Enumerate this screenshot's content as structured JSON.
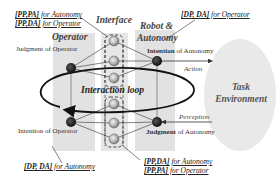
{
  "diagram": {
    "columns": {
      "operator": {
        "label": "Operator"
      },
      "interface": {
        "label": "Interface"
      },
      "robot": {
        "label_line1": "Robot &",
        "label_line2": "Autonomy"
      }
    },
    "nodes": {
      "judgment_operator": {
        "label": "Judgment of Operator",
        "strong": "Judgment",
        "rest": " of Operator"
      },
      "intention_operator": {
        "label": "Intention of Operator",
        "strong": "Intention",
        "rest": " of Operator"
      },
      "intention_autonomy": {
        "label": "Intention of Autonomy",
        "strong": "Intention",
        "rest": " of Autonomy"
      },
      "judgment_autonomy": {
        "label": "Judgment of Autonomy",
        "strong": "Judgment",
        "rest": " of Autonomy"
      }
    },
    "annotations": {
      "top_left": [
        {
          "key": "[PP,PA]",
          "text": " for Autonomy"
        },
        {
          "key": "[PP,DA]",
          "text": " for Operator"
        }
      ],
      "top_right": [
        {
          "key": "[DP, DA]",
          "text": " for Operator"
        }
      ],
      "bottom_left": [
        {
          "key": "[DP, DA]",
          "text": " for Autonomy"
        }
      ],
      "bottom_right": [
        {
          "key": "[PP,DA]",
          "text": " for Autonomy"
        },
        {
          "key": "[PP,PA]",
          "text": " for Operator"
        }
      ]
    },
    "arrows": {
      "action": "Action",
      "perception": "Perception"
    },
    "loop_label": "Interaction loop",
    "environment": {
      "line1": "Task",
      "line2": "Environment"
    },
    "colors": {
      "column_fill": "#e2e2e2",
      "environment_fill": "#e9e9e9",
      "node_dark": "#1a1a1a",
      "line": "#333333",
      "loop": "#111111"
    }
  }
}
